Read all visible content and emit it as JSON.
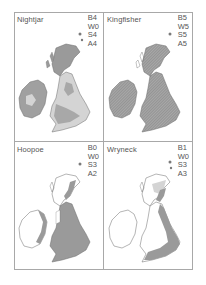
{
  "figure": {
    "panels": [
      {
        "name": "Nightjar",
        "codes": [
          "B4",
          "W0",
          "S4",
          "A4"
        ],
        "fill": "mixed-dark-light"
      },
      {
        "name": "Kingfisher",
        "codes": [
          "B5",
          "W5",
          "S5",
          "A5"
        ],
        "fill": "hatched-full"
      },
      {
        "name": "Hoopoe",
        "codes": [
          "B0",
          "W0",
          "S3",
          "A2"
        ],
        "fill": "south-east-dark"
      },
      {
        "name": "Wryneck",
        "codes": [
          "B1",
          "W0",
          "S3",
          "A3"
        ],
        "fill": "east-coast-dark"
      }
    ],
    "colors": {
      "frame": "#a8a8a8",
      "dark_fill": "#9a9a9a",
      "light_fill": "#d4d4d4",
      "outline": "#6a6a6a",
      "text": "#555555"
    }
  }
}
